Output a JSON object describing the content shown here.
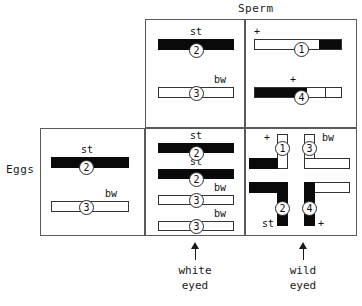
{
  "figure": {
    "sperm_label": "Sperm",
    "eggs_label": "Eggs"
  },
  "captions": {
    "white_line1": "white",
    "white_line2": "eyed",
    "wild_line1": "wild",
    "wild_line2": "eyed"
  },
  "alleles": {
    "st": "st",
    "bw": "bw",
    "plus": "+"
  },
  "numerals": {
    "one": "1",
    "two": "2",
    "three": "3",
    "four": "4"
  },
  "colors": {
    "chromosome_dark": "#0a0a0a",
    "chromosome_light": "#ffffff",
    "outline": "#333333",
    "box_border": "#5a5a5a",
    "text": "#111111"
  },
  "cells": {
    "sperm_mutant": {
      "name": "sperm-mutant-gamete",
      "chromosomes": [
        {
          "id": "2",
          "allele": "st",
          "fill": "solid"
        },
        {
          "id": "3",
          "allele": "bw",
          "fill": "open"
        }
      ]
    },
    "sperm_wildtype": {
      "name": "sperm-wildtype-gamete",
      "chromosomes": [
        {
          "id": "1",
          "allele": "+",
          "fill": "open-with-dark-right-tip"
        },
        {
          "id": "4",
          "allele": "+",
          "fill": "dark-left-open-right"
        }
      ]
    },
    "eggs_mutant": {
      "name": "egg-mutant-gamete",
      "chromosomes": [
        {
          "id": "2",
          "allele": "st",
          "fill": "solid"
        },
        {
          "id": "3",
          "allele": "bw",
          "fill": "open"
        }
      ]
    },
    "white_eyed_zygote": {
      "name": "white-eyed-zygote",
      "chromosomes": [
        {
          "id": "2",
          "allele": "st",
          "fill": "solid"
        },
        {
          "id": "2",
          "allele": "st",
          "fill": "solid"
        },
        {
          "id": "3",
          "allele": "bw",
          "fill": "open"
        },
        {
          "id": "3",
          "allele": "bw",
          "fill": "open"
        }
      ]
    },
    "wild_eyed_zygote": {
      "name": "wild-eyed-zygote",
      "chromosomes": [
        {
          "id": "1",
          "allele": "+",
          "shape": "bent",
          "fill": "open-vertical-dark-horizontal"
        },
        {
          "id": "3",
          "allele": "bw",
          "shape": "bent",
          "fill": "open"
        },
        {
          "id": "2",
          "allele": "st",
          "shape": "bent",
          "fill": "solid"
        },
        {
          "id": "4",
          "allele": "+",
          "shape": "bent",
          "fill": "dark-vertical-open-horizontal"
        }
      ]
    }
  }
}
